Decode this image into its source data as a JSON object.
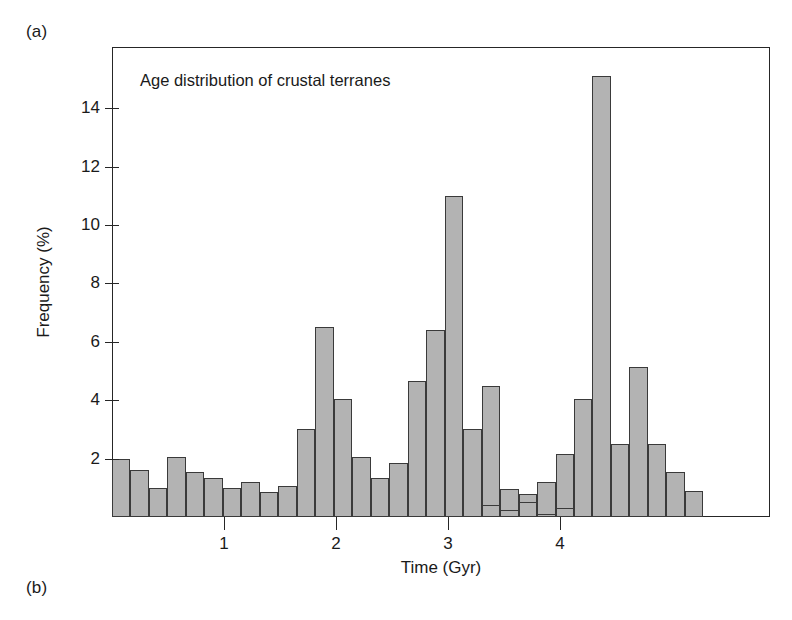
{
  "figure": {
    "panel_a_label": "(a)",
    "panel_b_label": "(b)"
  },
  "chart_data": {
    "type": "bar",
    "title": "Age distribution of crustal terranes",
    "xlabel": "Time (Gyr)",
    "ylabel": "Frequency (%)",
    "xlim": [
      0,
      5.875
    ],
    "ylim": [
      0,
      16.1
    ],
    "xticks": [
      1,
      2,
      3,
      4
    ],
    "xtick_labels": [
      "1",
      "2",
      "3",
      "4"
    ],
    "yticks": [
      2,
      4,
      6,
      8,
      10,
      12,
      14
    ],
    "ytick_labels": [
      "2",
      "4",
      "6",
      "8",
      "10",
      "12",
      "14"
    ],
    "grid": false,
    "legend": null,
    "bin_width": 0.165,
    "bar_color": "#b3b3b3",
    "bar_edge_color": "#3a3a3a",
    "x": [
      0.083,
      0.248,
      0.413,
      0.578,
      0.743,
      0.908,
      1.073,
      1.238,
      1.403,
      1.568,
      1.733,
      1.898,
      2.063,
      2.228,
      2.393,
      2.558,
      2.723,
      2.888,
      3.053,
      3.218,
      3.383,
      3.548,
      3.713,
      3.878,
      4.043,
      4.208,
      4.373,
      4.538,
      4.703,
      4.868,
      5.033,
      5.198
    ],
    "bin_starts": [
      0.0,
      0.165,
      0.33,
      0.495,
      0.66,
      0.825,
      0.99,
      1.155,
      1.32,
      1.485,
      1.65,
      1.815,
      1.98,
      2.145,
      2.31,
      2.475,
      2.64,
      2.805,
      2.97,
      3.135,
      3.3,
      3.465,
      3.63,
      3.795,
      3.96,
      4.125,
      4.29,
      4.455,
      4.62,
      4.785,
      4.95,
      5.115
    ],
    "categories": [
      "0.00",
      "0.17",
      "0.33",
      "0.50",
      "0.66",
      "0.83",
      "0.99",
      "1.16",
      "1.32",
      "1.49",
      "1.65",
      "1.82",
      "1.98",
      "2.15",
      "2.31",
      "2.48",
      "2.64",
      "2.81",
      "2.97",
      "3.14",
      "3.30",
      "3.47",
      "3.63",
      "3.80",
      "3.96",
      "4.13",
      "4.29",
      "4.46",
      "4.62",
      "4.79",
      "4.95",
      "5.12"
    ],
    "values": [
      2.0,
      1.6,
      1.0,
      2.05,
      1.55,
      1.35,
      1.0,
      1.2,
      0.85,
      1.05,
      3.0,
      6.5,
      4.05,
      2.05,
      1.35,
      1.85,
      4.65,
      6.4,
      11.0,
      3.0,
      4.5,
      0.95,
      0.8,
      1.2,
      2.15,
      4.05,
      15.1,
      2.5,
      5.15,
      2.5,
      1.55,
      0.9
    ],
    "tail": {
      "note": "values continue as a low tail beyond 3.3 Gyr",
      "x": [
        3.3,
        3.465,
        3.63,
        3.795,
        3.96
      ],
      "values": [
        0.4,
        0.25,
        0.5,
        0.1,
        0.3
      ]
    },
    "series": [
      {
        "name": "Age distribution of crustal terranes",
        "values": [
          2.0,
          1.6,
          1.0,
          2.05,
          1.55,
          1.35,
          1.0,
          1.2,
          0.85,
          1.05,
          3.0,
          6.5,
          4.05,
          2.05,
          1.35,
          1.85,
          4.65,
          6.4,
          11.0,
          3.0,
          4.5,
          0.95,
          0.8,
          1.2,
          2.15,
          4.05,
          15.1,
          2.5,
          5.15,
          2.5,
          1.55,
          0.9
        ]
      }
    ]
  }
}
